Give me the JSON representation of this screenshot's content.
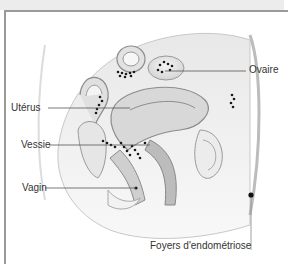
{
  "diagram": {
    "labels": {
      "uterus": "Utérus",
      "ovary": "Ovaire",
      "bladder": "Vessie",
      "vagina": "Vagin",
      "legend": "Foyers d'endométriose"
    },
    "colors": {
      "tissue": "#e4e4e4",
      "tissue_dark": "#bdbdbd",
      "outline": "#8c8c8c",
      "dots": "#1a1a1a",
      "leader_line": "#555555",
      "frame": "#9a9a9a"
    }
  }
}
